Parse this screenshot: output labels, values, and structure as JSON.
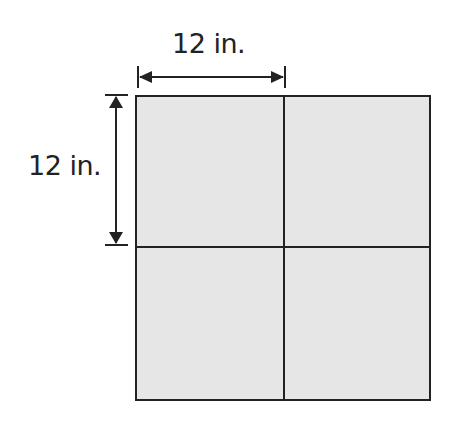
{
  "diagram": {
    "title": "",
    "shape": "square divided into 4 equal squares",
    "top_dimension_label": "12 in.",
    "left_dimension_label": "12 in.",
    "fill_color": "#e6e6e6",
    "line_color": "#222222"
  }
}
